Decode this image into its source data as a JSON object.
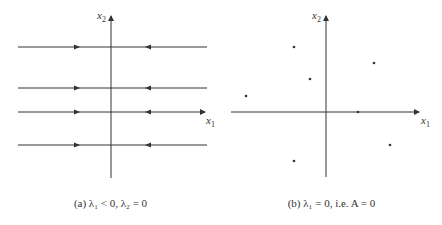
{
  "panels": [
    {
      "id": "a",
      "caption": "(a) λ₁ < 0,  λ₂ = 0",
      "x_axis_label": "x",
      "x_axis_sub": "1",
      "y_axis_label": "x",
      "y_axis_sub": "2",
      "trajectories": "horizontal lines flowing toward x2 axis",
      "line_y_positions": [
        47,
        88,
        112,
        145
      ]
    },
    {
      "id": "b",
      "caption": "(b)  λ₁ = 0, i.e. A = 0",
      "x_axis_label": "x",
      "x_axis_sub": "1",
      "y_axis_label": "x",
      "y_axis_sub": "2",
      "trajectories": "isolated fixed points",
      "points": [
        [
          -32,
          63
        ],
        [
          -16,
          30
        ],
        [
          -83,
          17
        ],
        [
          47,
          47
        ],
        [
          32,
          0
        ],
        [
          63,
          -33
        ],
        [
          -32,
          -49
        ]
      ]
    }
  ],
  "colors": {
    "line": "#333333",
    "background": "#ffffff"
  }
}
